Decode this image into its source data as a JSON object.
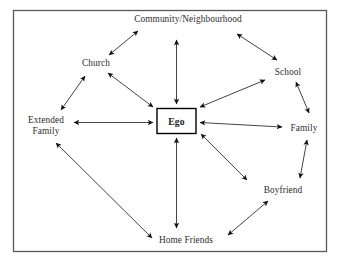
{
  "diagram": {
    "type": "ego-network-diagram",
    "frame": {
      "border_color": "#595959",
      "background": "#ffffff"
    },
    "center": {
      "label": "Ego",
      "shape": "rectangle",
      "box_color": "#000000",
      "text_color": "#1a1a1a"
    },
    "nodes": [
      {
        "id": "community",
        "label": "Community/Neighbourhood",
        "x": 188,
        "y": 19
      },
      {
        "id": "church",
        "label": "Church",
        "x": 96,
        "y": 63
      },
      {
        "id": "school",
        "label": "School",
        "x": 288,
        "y": 72
      },
      {
        "id": "extended_family",
        "label": "Extended\nFamily",
        "x": 46,
        "y": 125
      },
      {
        "id": "family",
        "label": "Family",
        "x": 304,
        "y": 128
      },
      {
        "id": "boyfriend",
        "label": "Boyfriend",
        "x": 283,
        "y": 190
      },
      {
        "id": "home_friends",
        "label": "Home Friends",
        "x": 186,
        "y": 240
      }
    ],
    "spokes": [
      {
        "from": "ego",
        "to": "community",
        "style": "double-arrow"
      },
      {
        "from": "ego",
        "to": "church",
        "style": "double-arrow"
      },
      {
        "from": "ego",
        "to": "school",
        "style": "double-arrow"
      },
      {
        "from": "ego",
        "to": "extended_family",
        "style": "double-arrow"
      },
      {
        "from": "ego",
        "to": "family",
        "style": "double-arrow"
      },
      {
        "from": "ego",
        "to": "boyfriend",
        "style": "double-arrow"
      },
      {
        "from": "ego",
        "to": "home_friends",
        "style": "double-arrow"
      }
    ],
    "perimeter_links": [
      {
        "from": "extended_family",
        "to": "church",
        "style": "double-arrow"
      },
      {
        "from": "church",
        "to": "community",
        "style": "double-arrow"
      },
      {
        "from": "community",
        "to": "school",
        "style": "double-arrow"
      },
      {
        "from": "school",
        "to": "family",
        "style": "double-arrow"
      },
      {
        "from": "family",
        "to": "boyfriend",
        "style": "double-arrow"
      },
      {
        "from": "boyfriend",
        "to": "home_friends",
        "style": "double-arrow"
      },
      {
        "from": "home_friends",
        "to": "extended_family",
        "style": "double-arrow"
      }
    ],
    "line_color": "#3a3a3a",
    "arrowhead_color": "#111111"
  }
}
